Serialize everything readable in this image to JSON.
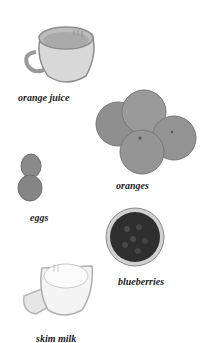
{
  "items": [
    {
      "name": "orange juice",
      "label": "orange juice"
    },
    {
      "name": "oranges",
      "label": "oranges"
    },
    {
      "name": "eggs",
      "label": "eggs"
    },
    {
      "name": "blueberries",
      "label": "blueberries"
    },
    {
      "name": "skim milk",
      "label": "skim milk"
    }
  ],
  "colors": {
    "background": "#ffffff",
    "label": "#222222",
    "orange": "#8a8a8a",
    "egg": "#7e7e7e",
    "blueberry": "#2b2b2b",
    "milk": "#f2f2f2"
  }
}
